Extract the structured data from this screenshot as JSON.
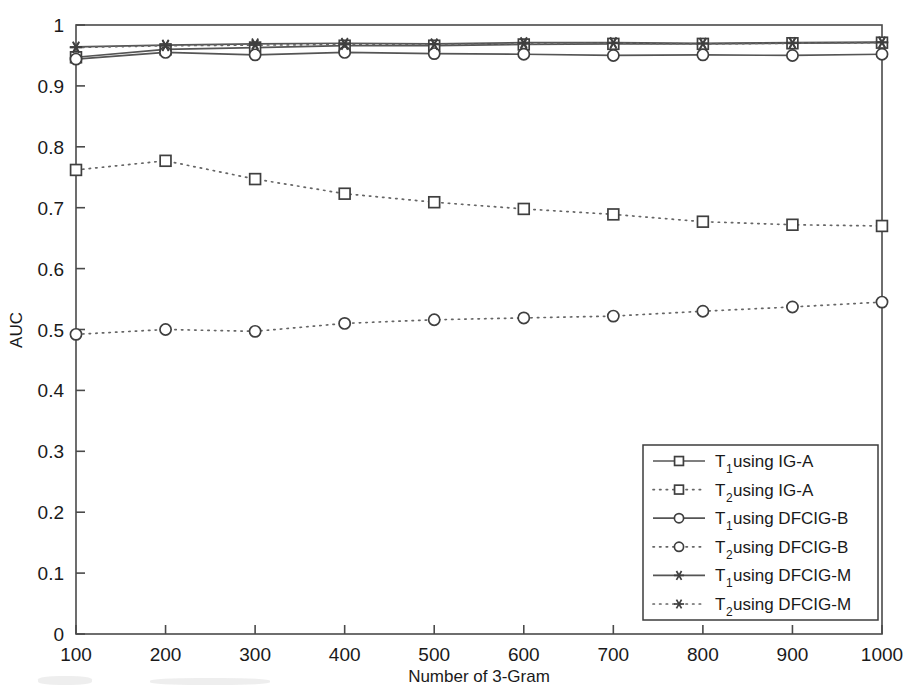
{
  "chart_data": {
    "type": "line",
    "title": "",
    "xlabel": "Number of 3-Gram",
    "ylabel": "AUC",
    "xlim": [
      100,
      1000
    ],
    "ylim": [
      0,
      1
    ],
    "grid": false,
    "legend_position": "bottom-right",
    "x": [
      100,
      200,
      300,
      400,
      500,
      600,
      700,
      800,
      900,
      1000
    ],
    "xticks": [
      "100",
      "200",
      "300",
      "400",
      "500",
      "600",
      "700",
      "800",
      "900",
      "1000"
    ],
    "yticks": [
      "0",
      "0.1",
      "0.2",
      "0.3",
      "0.4",
      "0.5",
      "0.6",
      "0.7",
      "0.8",
      "0.9",
      "1"
    ],
    "series": [
      {
        "name": "T_1 using IG-A",
        "label_base": "T",
        "label_sub": "1",
        "label_rest": " using IG-A",
        "marker": "square",
        "linestyle": "solid",
        "values": [
          0.947,
          0.96,
          0.963,
          0.966,
          0.966,
          0.968,
          0.969,
          0.969,
          0.97,
          0.971
        ]
      },
      {
        "name": "T_2 using IG-A",
        "label_base": "T",
        "label_sub": "2",
        "label_rest": " using IG-A",
        "marker": "square",
        "linestyle": "dotted",
        "values": [
          0.762,
          0.777,
          0.747,
          0.723,
          0.709,
          0.698,
          0.689,
          0.677,
          0.672,
          0.67
        ]
      },
      {
        "name": "T_1 using DFCIG-B",
        "label_base": "T",
        "label_sub": "1",
        "label_rest": " using DFCIG-B",
        "marker": "circle",
        "linestyle": "solid",
        "values": [
          0.944,
          0.955,
          0.951,
          0.955,
          0.953,
          0.952,
          0.95,
          0.951,
          0.95,
          0.952
        ]
      },
      {
        "name": "T_2 using DFCIG-B",
        "label_base": "T",
        "label_sub": "2",
        "label_rest": " using DFCIG-B",
        "marker": "circle",
        "linestyle": "dotted",
        "values": [
          0.492,
          0.5,
          0.497,
          0.51,
          0.516,
          0.519,
          0.522,
          0.53,
          0.537,
          0.545
        ]
      },
      {
        "name": "T_1 using DFCIG-M",
        "label_base": "T",
        "label_sub": "1",
        "label_rest": " using DFCIG-M",
        "marker": "asterisk",
        "linestyle": "solid",
        "values": [
          0.964,
          0.967,
          0.969,
          0.97,
          0.969,
          0.971,
          0.971,
          0.97,
          0.971,
          0.972
        ]
      },
      {
        "name": "T_2 using DFCIG-M",
        "label_base": "T",
        "label_sub": "2",
        "label_rest": " using DFCIG-M",
        "marker": "asterisk",
        "linestyle": "dotted",
        "values": [
          0.963,
          0.966,
          0.967,
          0.968,
          0.968,
          0.969,
          0.97,
          0.969,
          0.97,
          0.971
        ]
      }
    ]
  },
  "colors": {
    "line": "#555555",
    "marker": "#3f3f3f",
    "axis": "#4a4a4a",
    "text": "#1a1a1a",
    "background": "#ffffff"
  }
}
